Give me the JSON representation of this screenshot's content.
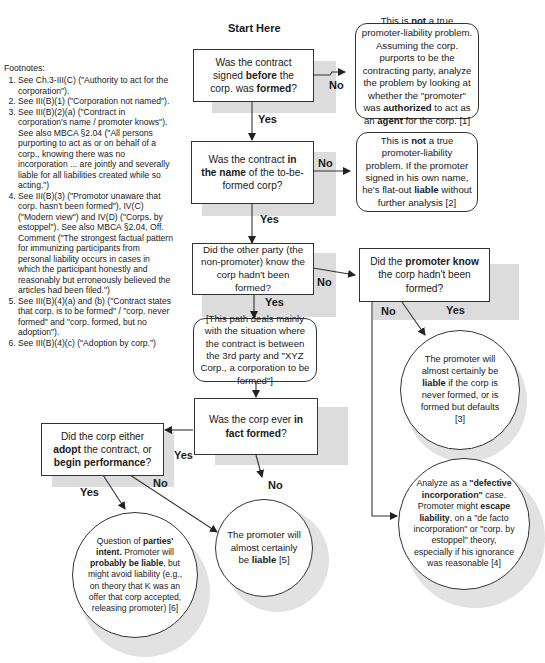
{
  "diagram": {
    "start_label": "Start Here",
    "footnotes": {
      "heading": "Footnotes:",
      "items": [
        "See Ch.3-III(C) (\"Authority to act for the corporation\").",
        "See III(B)(1) (\"Corporation not named\").",
        "See III(B)(2)(a) (\"Contract in corporation's name / promoter knows\"). See also MBCA §2.04 (\"All persons purporting to act as or on behalf of a corp., knowing there was no incorporation ... are jointly and severally liable for all liabilities created while so acting.\")",
        "See III(B)(3) (\"Promotor unaware that corp. hasn't been formed\"), IV(C) (\"Modern view\") and IV(D) (\"Corps. by estoppel\"). See also MBCA §2.04, Off. Comment (\"The strongest factual pattern for immunizing participants from personal liability occurs in cases in which the participant honestly and reasonably but erroneously believed the articles had been filed.\")",
        "See III(B)(4)(a) and (b) (\"Contract states that corp. is to be formed\" / \"corp. never formed\" and \"corp. formed, but no adoption\").",
        "See III(B)(4)(c) (\"Adoption by corp.\")"
      ]
    },
    "nodes": {
      "q1": {
        "pre": "Was the contract signed ",
        "b1": "before",
        "mid": " the corp. was ",
        "b2": "formed",
        "post": "?"
      },
      "r1": {
        "pre": "This is ",
        "b1": "not",
        "mid": " a true promoter-liability problem. Assuming the corp. purports to be the contracting party, analyze the problem by looking at whether the \"promoter\" was ",
        "b2": "authorized",
        "mid2": " to act as an ",
        "b3": "agent",
        "post": " for the corp. [1]"
      },
      "q2": {
        "pre": "Was the contract ",
        "b1": "in the name",
        "post": " of the to-be-formed corp?"
      },
      "r2": {
        "pre": "This is ",
        "b1": "not",
        "mid": " a true promoter-liability problem. If the promoter signed in his own name, he's flat-out ",
        "b2": "liable",
        "post": " without further analysis [2]"
      },
      "q3": {
        "text": "Did the other party (the non-promoter) know  the corp hadn't been formed?"
      },
      "q4": {
        "pre": "Did the ",
        "b1": "promoter know",
        "post": " the corp hadn't been formed?"
      },
      "note": {
        "text": "[This path deals mainly with the situation where the contract is between the 3rd party and \"XYZ Corp., a corporation to be formed\"]"
      },
      "r3": {
        "pre": "The promoter will almost certainly be ",
        "b1": "liable",
        "post": " if the corp is never formed, or is formed but defaults [3]"
      },
      "q5": {
        "pre": "Was the corp ever ",
        "b1": "in fact",
        "mid": " ",
        "b2": "formed",
        "post": "?"
      },
      "q6": {
        "pre": "Did the corp either ",
        "b1": "adopt",
        "mid": " the contract, or ",
        "b2": "begin performance",
        "post": "?"
      },
      "r4": {
        "pre": "Analyze as a ",
        "b1": "\"defective incorporation\"",
        "mid": " case. Promoter might ",
        "b2": "escape liability",
        "post": ", on a \"de facto incorporation\" or \"corp. by estoppel\" theory, especially if his ignorance was reasonable [4]"
      },
      "r5": {
        "pre": "The promoter will almost certainly be ",
        "b1": "liable",
        "post": " [5]"
      },
      "r6": {
        "pre": "Question of ",
        "b1": "parties' intent.",
        "mid": " Promoter will ",
        "b2": "probably be liable",
        "post": ", but might  avoid liability (e.g., on theory that K was an offer that corp accepted, releasing promoter) [6]"
      }
    },
    "edge_labels": {
      "q1_no": "No",
      "q1_yes": "Yes",
      "q2_no": "No",
      "q2_yes": "Yes",
      "q3_no": "No",
      "q3_yes": "Yes",
      "q4_no": "No",
      "q4_yes": "Yes",
      "q5_yes": "Yes",
      "q5_no": "No",
      "q6_yes": "Yes",
      "q6_no": "No"
    }
  }
}
